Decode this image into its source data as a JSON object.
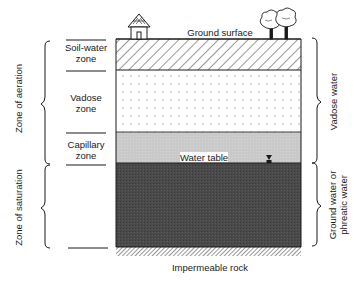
{
  "diagram": {
    "top_label": "Ground surface",
    "bottom_label": "Impermeable rock",
    "water_table_label": "Water table",
    "layers": [
      {
        "name": "soil-water",
        "label_line1": "Soil-water",
        "label_line2": "zone",
        "fill": "hatched"
      },
      {
        "name": "vadose",
        "label_line1": "Vadose",
        "label_line2": "zone",
        "fill": "dotted"
      },
      {
        "name": "capillary",
        "label_line1": "Capillary",
        "label_line2": "zone",
        "fill": "#c8c8c8"
      },
      {
        "name": "saturated",
        "fill": "#4a4a4a"
      }
    ],
    "left_brackets": {
      "aeration": "Zone of aeration",
      "saturation": "Zone of saturation"
    },
    "right_brackets": {
      "vadose_water": "Vadose water",
      "ground_water_line1": "Ground water or",
      "ground_water_line2": "phreatic water"
    },
    "icons": [
      "house-icon",
      "trees-icon",
      "water-table-marker-icon"
    ],
    "colors": {
      "line": "#1a1a1a",
      "capillary": "#c8c8c8",
      "saturated": "#4a4a4a",
      "background": "#ffffff"
    }
  }
}
